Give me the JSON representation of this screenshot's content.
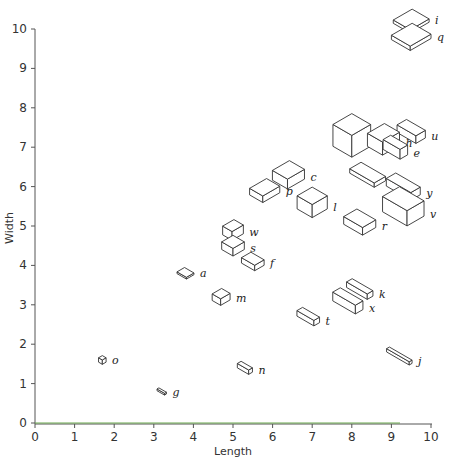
{
  "chart_data": {
    "type": "scatter",
    "subtype": "isometric-box-glyph",
    "title": "",
    "xlabel": "Length",
    "ylabel": "Width",
    "xlim": [
      0,
      10
    ],
    "ylim": [
      0,
      10
    ],
    "xticks": [
      0,
      1,
      2,
      3,
      4,
      5,
      6,
      7,
      8,
      9,
      10
    ],
    "yticks": [
      0,
      1,
      2,
      3,
      4,
      5,
      6,
      7,
      8,
      9,
      10
    ],
    "grid": false,
    "legend": null,
    "axis_color": "#555555",
    "baseline_color": "#6aa84f",
    "points": [
      {
        "label": "i",
        "x": 9.5,
        "y": 10.2,
        "w": 1.0,
        "d": 0.9,
        "h": 0.15
      },
      {
        "label": "q",
        "x": 9.5,
        "y": 9.8,
        "w": 1.1,
        "d": 1.0,
        "h": 0.2
      },
      {
        "label": "d",
        "x": 8.0,
        "y": 7.3,
        "w": 1.0,
        "d": 1.0,
        "h": 1.0
      },
      {
        "label": "h",
        "x": 8.8,
        "y": 7.2,
        "w": 0.9,
        "d": 0.8,
        "h": 0.6
      },
      {
        "label": "u",
        "x": 9.5,
        "y": 7.4,
        "w": 0.5,
        "d": 1.0,
        "h": 0.35
      },
      {
        "label": "e",
        "x": 9.1,
        "y": 7.0,
        "w": 0.4,
        "d": 0.9,
        "h": 0.45
      },
      {
        "label": "c",
        "x": 6.4,
        "y": 6.3,
        "w": 0.9,
        "d": 0.8,
        "h": 0.45
      },
      {
        "label": "p",
        "x": 5.8,
        "y": 5.9,
        "w": 0.9,
        "d": 0.7,
        "h": 0.3
      },
      {
        "label": "l",
        "x": 7.0,
        "y": 5.6,
        "w": 0.8,
        "d": 0.8,
        "h": 0.6
      },
      {
        "label": "b",
        "x": 8.4,
        "y": 6.3,
        "w": 0.6,
        "d": 1.3,
        "h": 0.2
      },
      {
        "label": "y",
        "x": 9.3,
        "y": 6.0,
        "w": 0.5,
        "d": 1.3,
        "h": 0.35
      },
      {
        "label": "v",
        "x": 9.3,
        "y": 5.5,
        "w": 0.9,
        "d": 1.3,
        "h": 0.7
      },
      {
        "label": "r",
        "x": 8.2,
        "y": 5.1,
        "w": 0.7,
        "d": 1.0,
        "h": 0.35
      },
      {
        "label": "w",
        "x": 5.0,
        "y": 4.9,
        "w": 0.6,
        "d": 0.5,
        "h": 0.4
      },
      {
        "label": "s",
        "x": 5.0,
        "y": 4.5,
        "w": 0.6,
        "d": 0.6,
        "h": 0.35
      },
      {
        "label": "f",
        "x": 5.5,
        "y": 4.1,
        "w": 0.5,
        "d": 0.7,
        "h": 0.25
      },
      {
        "label": "a",
        "x": 3.8,
        "y": 3.8,
        "w": 0.4,
        "d": 0.5,
        "h": 0.08
      },
      {
        "label": "m",
        "x": 4.7,
        "y": 3.2,
        "w": 0.5,
        "d": 0.45,
        "h": 0.3
      },
      {
        "label": "k",
        "x": 8.2,
        "y": 3.4,
        "w": 0.3,
        "d": 1.1,
        "h": 0.25
      },
      {
        "label": "x",
        "x": 7.9,
        "y": 3.1,
        "w": 0.4,
        "d": 1.2,
        "h": 0.4
      },
      {
        "label": "t",
        "x": 6.9,
        "y": 2.7,
        "w": 0.3,
        "d": 0.9,
        "h": 0.25
      },
      {
        "label": "j",
        "x": 9.2,
        "y": 1.7,
        "w": 0.15,
        "d": 1.2,
        "h": 0.15
      },
      {
        "label": "n",
        "x": 5.3,
        "y": 1.4,
        "w": 0.2,
        "d": 0.6,
        "h": 0.2
      },
      {
        "label": "o",
        "x": 1.7,
        "y": 1.6,
        "w": 0.2,
        "d": 0.2,
        "h": 0.2
      },
      {
        "label": "g",
        "x": 3.2,
        "y": 0.8,
        "w": 0.1,
        "d": 0.4,
        "h": 0.08
      }
    ]
  }
}
